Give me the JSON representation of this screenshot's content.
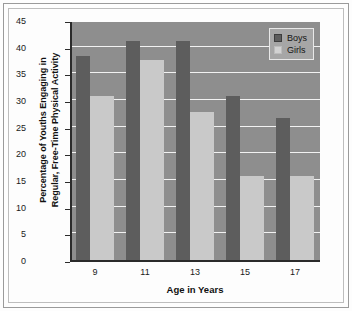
{
  "chart_data": {
    "type": "bar",
    "title": "",
    "xlabel": "Age in Years",
    "ylabel": "Percentage of Youths Engaging in Regular, Free-Time Physical Activity",
    "ylabel_line1": "Percentage of Youths Engaging in",
    "ylabel_line2": "Regular, Free-Time Physical Activity",
    "categories": [
      "9",
      "11",
      "13",
      "15",
      "17"
    ],
    "series": [
      {
        "name": "Boys",
        "color": "#5d5d5d",
        "values": [
          38.2,
          41.0,
          41.0,
          30.8,
          26.7
        ]
      },
      {
        "name": "Girls",
        "color": "#c9c9c9",
        "values": [
          30.8,
          37.5,
          27.8,
          15.8,
          15.8
        ]
      }
    ],
    "ylim": [
      0,
      45
    ],
    "yticks": [
      0,
      5,
      10,
      15,
      20,
      25,
      30,
      35,
      40,
      45
    ],
    "ytick_labels": [
      "0",
      "5",
      "10",
      "15",
      "20",
      "25",
      "30",
      "35",
      "40",
      "45"
    ],
    "grid": true,
    "grid_color": "#f2f2f2",
    "legend_position": "top-right",
    "plot_background": "#8e8e8e"
  },
  "legend": {
    "entries": [
      {
        "label": "Boys",
        "swatch": "dark-gray-swatch"
      },
      {
        "label": "Girls",
        "swatch": "light-gray-swatch"
      }
    ]
  }
}
